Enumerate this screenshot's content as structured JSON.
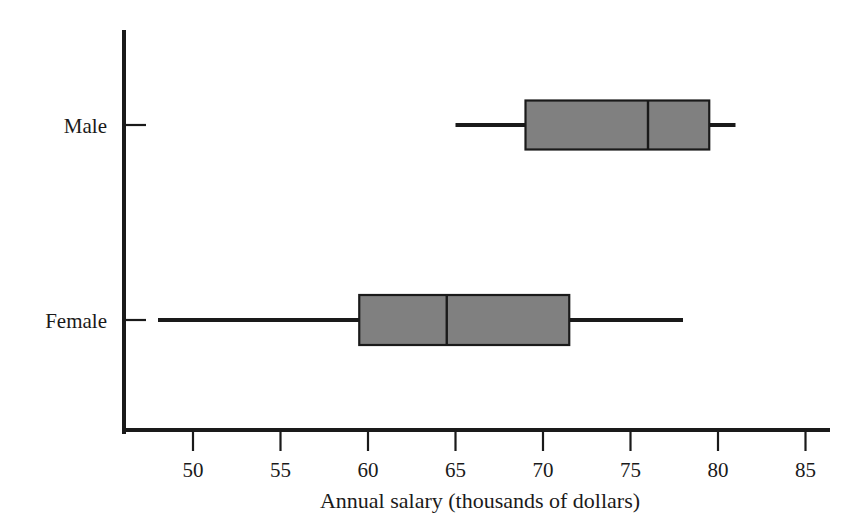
{
  "chart_data": {
    "type": "box",
    "title": "",
    "xlabel": "Annual salary (thousands of dollars)",
    "ylabel": "",
    "xlim": [
      46,
      86.5
    ],
    "xticks": [
      50,
      55,
      60,
      65,
      70,
      75,
      80,
      85
    ],
    "xticklabels": [
      "50",
      "55",
      "60",
      "65",
      "70",
      "75",
      "80",
      "85"
    ],
    "categories": [
      "Male",
      "Female"
    ],
    "grid": false,
    "legend": null,
    "orientation": "horizontal",
    "box_fill_color": "#808080",
    "line_color": "#1a1a1a",
    "boxes": [
      {
        "label": "Male",
        "min": 65.0,
        "q1": 69.0,
        "median": 76.0,
        "q3": 79.5,
        "max": 81.0
      },
      {
        "label": "Female",
        "min": 48.0,
        "q1": 59.5,
        "median": 64.5,
        "q3": 71.5,
        "max": 78.0
      }
    ]
  },
  "axis": {
    "x_title": "Annual salary (thousands of dollars)",
    "tick_50": "50",
    "tick_55": "55",
    "tick_60": "60",
    "tick_65": "65",
    "tick_70": "70",
    "tick_75": "75",
    "tick_80": "80",
    "tick_85": "85"
  },
  "categories": {
    "male_label": "Male",
    "female_label": "Female"
  }
}
